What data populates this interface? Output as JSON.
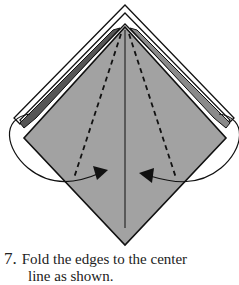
{
  "diagram": {
    "colors": {
      "paper": "#a2a2a2",
      "paper_edge": "#7a7a7a",
      "line": "#111111",
      "background": "#ffffff"
    },
    "elements": [
      "diamond-base",
      "center-crease",
      "left-fold-line",
      "right-fold-line",
      "left-fold-arrow",
      "right-fold-arrow"
    ]
  },
  "caption": {
    "step_number": "7.",
    "text_line1": "Fold the edges to the center",
    "text_line2": "line as shown."
  }
}
